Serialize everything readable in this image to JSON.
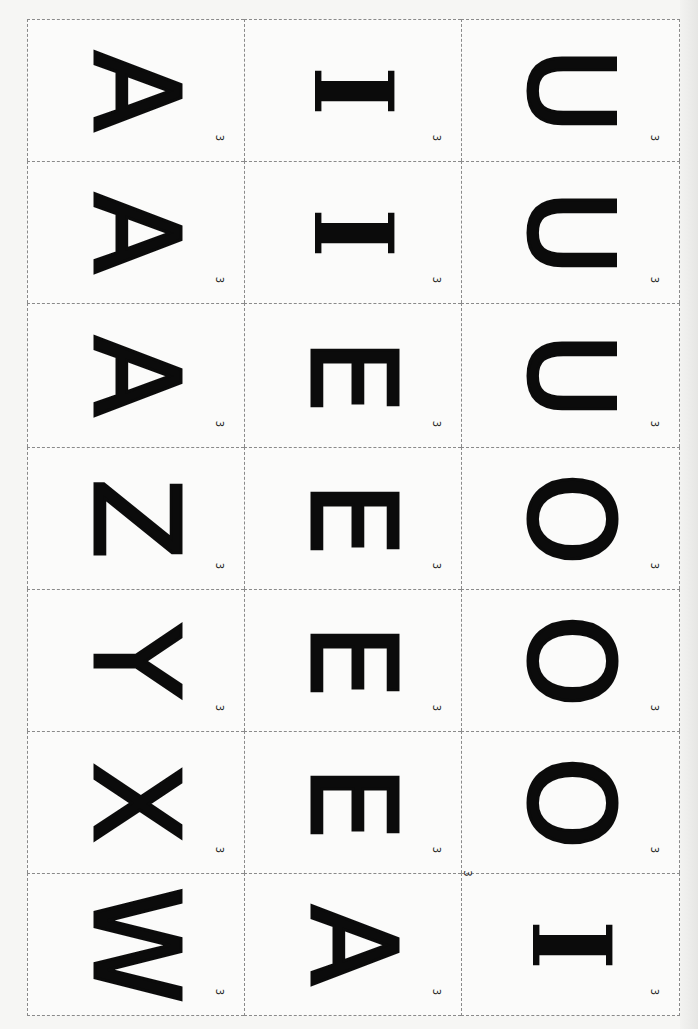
{
  "sheet": {
    "columns": 3,
    "rows": 7,
    "card_number": "3",
    "stray_number": "3",
    "cards": [
      {
        "col": 0,
        "row": 0,
        "letter": "A",
        "number": "3"
      },
      {
        "col": 0,
        "row": 1,
        "letter": "A",
        "number": "3"
      },
      {
        "col": 0,
        "row": 2,
        "letter": "A",
        "number": "3"
      },
      {
        "col": 0,
        "row": 3,
        "letter": "Z",
        "number": "3"
      },
      {
        "col": 0,
        "row": 4,
        "letter": "Y",
        "number": "3"
      },
      {
        "col": 0,
        "row": 5,
        "letter": "X",
        "number": "3"
      },
      {
        "col": 0,
        "row": 6,
        "letter": "W",
        "number": "3"
      },
      {
        "col": 1,
        "row": 0,
        "letter": "I",
        "number": "3"
      },
      {
        "col": 1,
        "row": 1,
        "letter": "I",
        "number": "3"
      },
      {
        "col": 1,
        "row": 2,
        "letter": "E",
        "number": "3"
      },
      {
        "col": 1,
        "row": 3,
        "letter": "E",
        "number": "3"
      },
      {
        "col": 1,
        "row": 4,
        "letter": "E",
        "number": "3"
      },
      {
        "col": 1,
        "row": 5,
        "letter": "E",
        "number": "3"
      },
      {
        "col": 1,
        "row": 6,
        "letter": "A",
        "number": "3"
      },
      {
        "col": 2,
        "row": 0,
        "letter": "U",
        "number": "3"
      },
      {
        "col": 2,
        "row": 1,
        "letter": "U",
        "number": "3"
      },
      {
        "col": 2,
        "row": 2,
        "letter": "U",
        "number": "3"
      },
      {
        "col": 2,
        "row": 3,
        "letter": "O",
        "number": "3"
      },
      {
        "col": 2,
        "row": 4,
        "letter": "O",
        "number": "3"
      },
      {
        "col": 2,
        "row": 5,
        "letter": "O",
        "number": "3"
      },
      {
        "col": 2,
        "row": 6,
        "letter": "I",
        "number": "3"
      }
    ]
  },
  "colors": {
    "ink": "#0b0b0b",
    "paper": "#fbfbfa",
    "dash": "#8a8a8a"
  }
}
